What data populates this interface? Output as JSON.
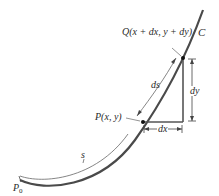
{
  "diagram": {
    "curve_label": "C",
    "point_q_label": "Q(x + dx, y + dy)",
    "point_p_label": "P(x, y)",
    "arc_label_ds": "ds",
    "arc_label_s": "s",
    "start_point_label": "P",
    "start_point_subscript": "0",
    "dx_label": "dx",
    "dy_label": "dy",
    "colors": {
      "curve": "#4a4a4a",
      "triangle": "#555555",
      "text": "#2a2a2a",
      "background": "#ffffff"
    }
  }
}
